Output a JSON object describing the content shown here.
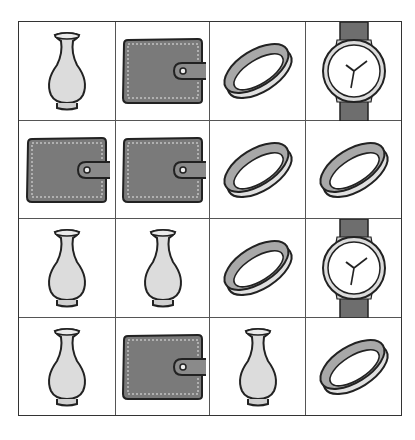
{
  "puzzle": {
    "rows": 4,
    "cols": 4,
    "cells": [
      [
        "vase",
        "wallet",
        "bracelet",
        "watch"
      ],
      [
        "wallet",
        "wallet",
        "bracelet",
        "bracelet"
      ],
      [
        "vase",
        "vase",
        "bracelet",
        "watch"
      ],
      [
        "vase",
        "wallet",
        "vase",
        "bracelet"
      ]
    ],
    "colors": {
      "outline": "#222222",
      "grid_line": "#555555",
      "vase_fill": "#dcdcdc",
      "wallet_fill": "#7a7a7a",
      "bracelet_light": "#e0e0e0",
      "bracelet_dark": "#a8a8a8",
      "watch_strap": "#6e6e6e",
      "watch_face": "#ffffff"
    }
  }
}
